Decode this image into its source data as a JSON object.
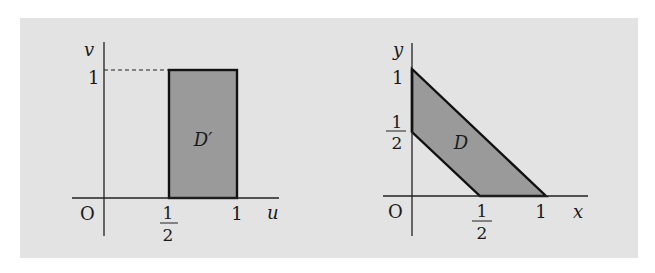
{
  "figure": {
    "background_color": "#e3e3e3",
    "region_fill": "#9a9a9a",
    "stroke_color": "#111111"
  },
  "left_plot": {
    "title": "uv-plane",
    "origin_label": "O",
    "x_axis_label": "u",
    "y_axis_label": "v",
    "x_ticks": [
      {
        "num": "1",
        "den": "2"
      },
      {
        "label": "1"
      }
    ],
    "y_ticks": [
      {
        "label": "1"
      }
    ],
    "region_label": "D′",
    "region_vertices": [
      [
        0.5,
        0
      ],
      [
        1,
        0
      ],
      [
        1,
        1
      ],
      [
        0.5,
        1
      ]
    ],
    "dashed_guide": "from (0,1) to (1/2,1)"
  },
  "right_plot": {
    "title": "xy-plane",
    "origin_label": "O",
    "x_axis_label": "x",
    "y_axis_label": "y",
    "x_ticks": [
      {
        "num": "1",
        "den": "2"
      },
      {
        "label": "1"
      }
    ],
    "y_ticks": [
      {
        "num": "1",
        "den": "2"
      },
      {
        "label": "1"
      }
    ],
    "region_label": "D",
    "region_vertices": [
      [
        0,
        0.5
      ],
      [
        0,
        1
      ],
      [
        1,
        0
      ],
      [
        0.5,
        0
      ]
    ]
  }
}
